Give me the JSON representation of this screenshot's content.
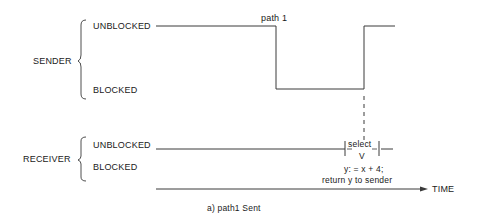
{
  "sender": {
    "label": "SENDER",
    "state_unblocked": "UNBLOCKED",
    "state_blocked": "BLOCKED",
    "event_label": "path 1"
  },
  "receiver": {
    "label": "RECEIVER",
    "state_unblocked": "UNBLOCKED",
    "state_blocked": "BLOCKED",
    "select_label": "select",
    "select_sub": "V",
    "action_line1": "y: = x + 4;",
    "action_line2": "return y to sender"
  },
  "axis": {
    "label": "TIME"
  },
  "caption": "a)  path1 Sent",
  "colors": {
    "line": "#3a3a3a",
    "text": "#1a1a1a",
    "background": "#ffffff"
  }
}
